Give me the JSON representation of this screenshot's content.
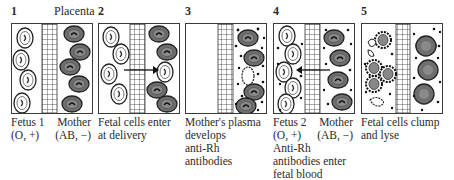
{
  "diagram": {
    "placenta_label": "Placenta",
    "colors": {
      "maternal_cell": "#6e6e6e",
      "fetal_cell": "#ffffff",
      "outline": "#2a2a2a",
      "antibody_dot": "#1a1a1a"
    },
    "panels": [
      {
        "number": "1",
        "left_label": [
          "Fetus 1",
          "(O, +)"
        ],
        "right_label": [
          "Mother",
          "(AB, −)"
        ],
        "caption": ""
      },
      {
        "number": "2",
        "caption": [
          "Fetal cells enter",
          "at delivery"
        ],
        "arrow": "left-to-right"
      },
      {
        "number": "3",
        "caption": [
          "Mother's plasma",
          "develops",
          "anti-Rh",
          "antibodies"
        ]
      },
      {
        "number": "4",
        "left_label": [
          "Fetus 2",
          "(O, +)"
        ],
        "right_label": [
          "Mother",
          "(AB, −)"
        ],
        "caption": [
          "Anti-Rh",
          "antibodies enter",
          "fetal blood"
        ],
        "arrow": "right-to-left"
      },
      {
        "number": "5",
        "caption": [
          "Fetal cells clump",
          "and lyse"
        ]
      }
    ]
  }
}
